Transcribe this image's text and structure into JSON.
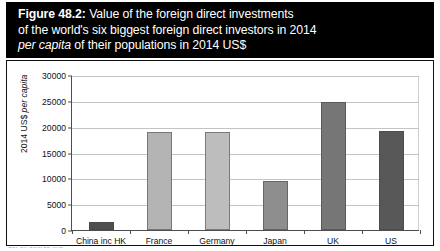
{
  "figure": {
    "number_label": "Figure 48.2:",
    "title_line1_rest": " Value of the foreign direct investments",
    "title_line2": "of the world's six biggest foreign direct investors in 2014",
    "title_line3_italic": "per capita",
    "title_line3_rest": " of their populations in 2014 US$",
    "banner_color": "#000000",
    "banner_text_color": "#ffffff"
  },
  "axis": {
    "y_title_prefix": "2014 US$ ",
    "y_title_italic": "per capita",
    "y_ticks": [
      "30000",
      "25000",
      "20000",
      "15000",
      "10000",
      "5000",
      "0"
    ]
  },
  "source_note": {
    "text": "cut-off source line"
  },
  "chart_data": {
    "type": "bar",
    "title": "Figure 48.2: Value of the foreign direct investments of the world's six biggest foreign direct investors in 2014 per capita of their populations in 2014 US$",
    "xlabel": "",
    "ylabel": "2014 US$ per capita",
    "ylim": [
      0,
      30000
    ],
    "ytick_step": 5000,
    "grid": true,
    "legend": false,
    "categories": [
      "China inc HK",
      "France",
      "Germany",
      "Japan",
      "UK",
      "US"
    ],
    "values": [
      1500,
      19000,
      19000,
      9400,
      24800,
      19200
    ],
    "bar_colors": [
      "#4f4f4f",
      "#b4b4b4",
      "#bdbdbd",
      "#8e8e8e",
      "#767676",
      "#585858"
    ]
  }
}
